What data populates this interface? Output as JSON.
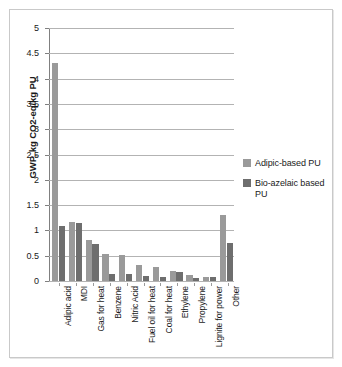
{
  "chart_data": {
    "type": "bar",
    "title": "",
    "xlabel": "",
    "ylabel": "GWP, kg CO2-eq/kg PU",
    "ylim": [
      0,
      5
    ],
    "ytick_labels": [
      "5",
      "4.5",
      "4",
      "3.5",
      "3",
      "2.5",
      "2",
      "1.5",
      "1",
      "0.5",
      "0"
    ],
    "ytick_values": [
      5,
      4.5,
      4,
      3.5,
      3,
      2.5,
      2,
      1.5,
      1,
      0.5,
      0
    ],
    "grid": true,
    "legend_position": "right",
    "categories": [
      "Adipic acid",
      "MDI",
      "Gas for heat",
      "Benzene",
      "Nitric Acid",
      "Fuel oil for heat",
      "Coal for heat",
      "Ethylene",
      "Propylene",
      "Lignite for power",
      "Other"
    ],
    "series": [
      {
        "name": "Adipic-based PU",
        "color": "#9a9a9a",
        "values": [
          4.31,
          1.16,
          0.82,
          0.54,
          0.52,
          0.32,
          0.28,
          0.19,
          0.11,
          0.08,
          1.31
        ]
      },
      {
        "name": "Bio-azelaic based PU",
        "color": "#6e6e6e",
        "values": [
          1.09,
          1.15,
          0.74,
          0.14,
          0.14,
          0.1,
          0.08,
          0.17,
          0.05,
          0.07,
          0.76
        ]
      }
    ]
  },
  "legend": {
    "entries": [
      {
        "label": "Adipic-based PU"
      },
      {
        "label": "Bio-azelaic based PU"
      }
    ]
  }
}
